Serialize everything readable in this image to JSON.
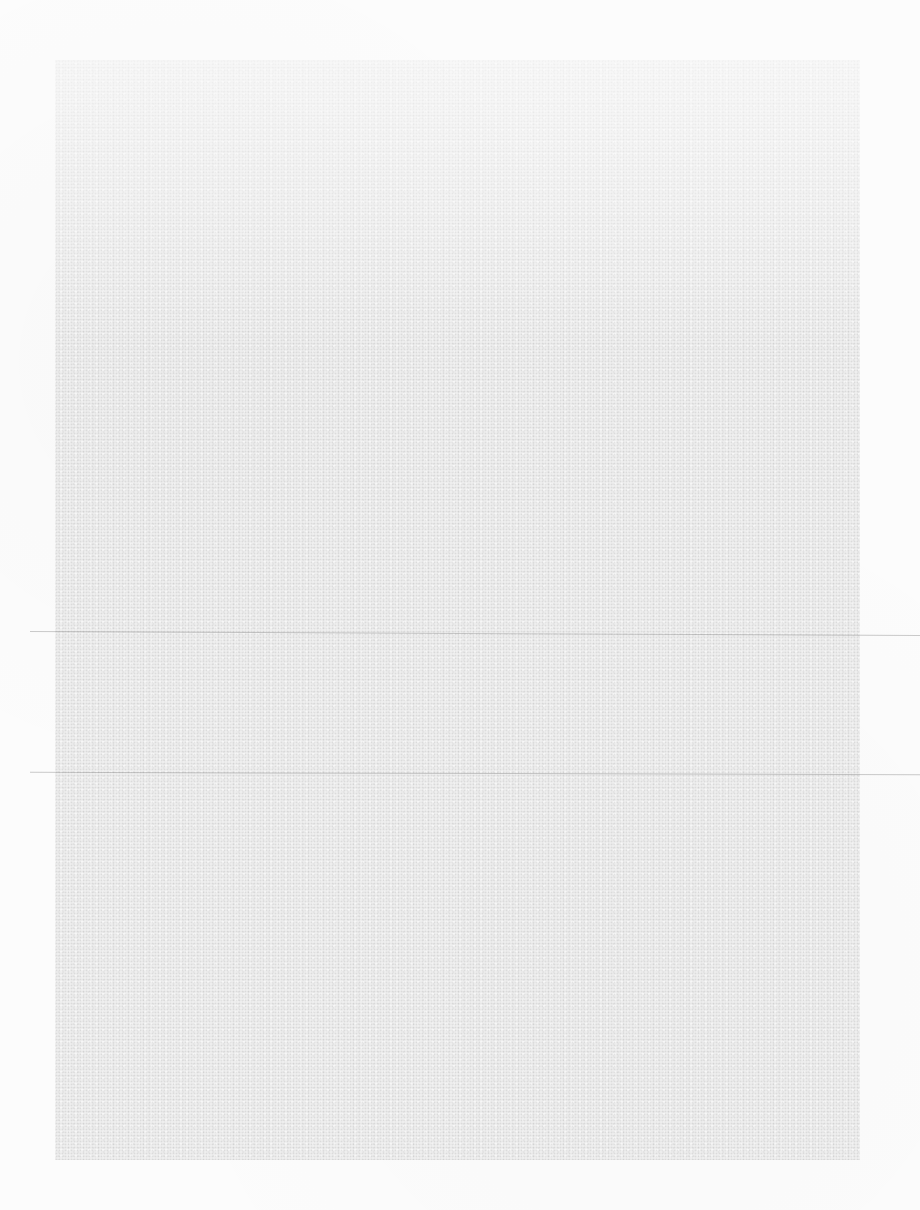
{
  "document": {
    "type": "blank scanned page",
    "text_content": [],
    "colors": {
      "paper": "#fcfcfc",
      "scan_area": "#ececec",
      "fold_line": "#8c8c8c"
    }
  }
}
